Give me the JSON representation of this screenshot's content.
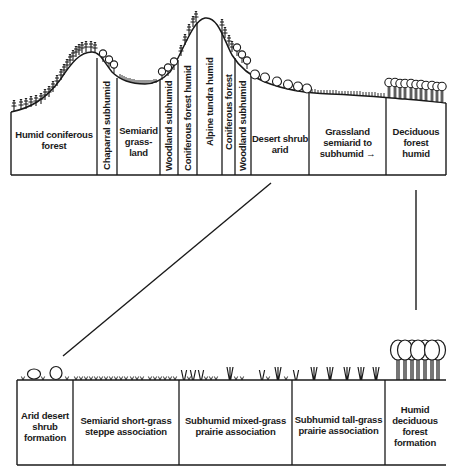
{
  "diagram": {
    "type": "vegetation-profile",
    "upper_profile": {
      "zones": [
        {
          "label": "Humid coniferous forest",
          "orientation": "horizontal"
        },
        {
          "label": "Chaparral subhumid",
          "orientation": "vertical"
        },
        {
          "label": "Semiarid grass-land",
          "orientation": "horizontal"
        },
        {
          "label": "Woodland subhumid",
          "orientation": "vertical"
        },
        {
          "label": "Coniferous forest humid",
          "orientation": "vertical"
        },
        {
          "label": "Alpine tundra humid",
          "orientation": "vertical"
        },
        {
          "label": "Coniferous forest",
          "orientation": "vertical"
        },
        {
          "label": "Woodland subhumid",
          "orientation": "vertical"
        },
        {
          "label": "Desert shrub arid",
          "orientation": "horizontal"
        },
        {
          "label": "Grassland semiarid to subhumid→",
          "orientation": "horizontal"
        },
        {
          "label": "Deciduous forest humid",
          "orientation": "horizontal"
        }
      ],
      "text": {
        "humid_coniferous_1": "Humid coniferous",
        "humid_coniferous_2": "forest",
        "chaparral": "Chaparral subhumid",
        "semiarid_1": "Semiarid",
        "semiarid_2": "grass-",
        "semiarid_3": "land",
        "woodland_1": "Woodland subhumid",
        "coniferous_humid": "Coniferous forest humid",
        "alpine": "Alpine tundra humid",
        "coniferous": "Coniferous forest",
        "woodland_2": "Woodland subhumid",
        "desert_1": "Desert shrub",
        "desert_2": "arid",
        "grassland_1": "Grassland",
        "grassland_2": "semiarid to",
        "grassland_3": "subhumid →",
        "deciduous_1": "Deciduous",
        "deciduous_2": "forest",
        "deciduous_3": "humid"
      }
    },
    "lower_profile": {
      "zones": [
        {
          "label": "Arid desert shrub formation"
        },
        {
          "label": "Semiarid short-grass steppe association"
        },
        {
          "label": "Subhumid mixed-grass prairie association"
        },
        {
          "label": "Subhumid tall-grass prairie association"
        },
        {
          "label": "Humid deciduous forest formation"
        }
      ],
      "text": {
        "arid_1": "Arid desert",
        "arid_2": "shrub",
        "arid_3": "formation",
        "shortgrass_1": "Semiarid short-grass",
        "shortgrass_2": "steppe association",
        "mixed_1": "Subhumid mixed-grass",
        "mixed_2": "prairie association",
        "tall_1": "Subhumid tall-grass",
        "tall_2": "prairie association",
        "humid_1": "Humid",
        "humid_2": "deciduous",
        "humid_3": "forest",
        "humid_4": "formation"
      }
    },
    "connectors": [
      {
        "name": "grassland-expansion-left",
        "from": "upper desert/grassland boundary",
        "to": "lower left edge"
      },
      {
        "name": "grassland-expansion-right",
        "from": "upper deciduous forest",
        "to": "lower humid forest"
      }
    ],
    "colors": {
      "ink": "#1a1a1a",
      "background": "#ffffff"
    }
  }
}
